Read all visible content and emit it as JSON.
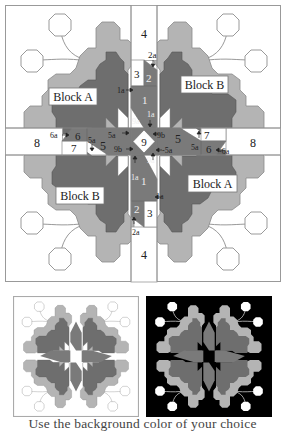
{
  "diagram": {
    "colors": {
      "background": "#ffffff",
      "light_fabric": "#b4b4b4",
      "dark_fabric": "#6e6e6e",
      "medium_fabric": "#8c8c8c",
      "outline": "#888888",
      "label_text": "#222222",
      "dark_preview_bg": "#000000"
    },
    "block_labels": {
      "top_left": "Block A",
      "top_right": "Block B",
      "bottom_left": "Block B",
      "bottom_right": "Block A"
    },
    "sashing_labels": {
      "top_4": "4",
      "bottom_4": "4",
      "left_8": "8",
      "right_8": "8",
      "center_9": "9"
    },
    "piece_labels": {
      "top": [
        "2a",
        "3",
        "2",
        "1a",
        "1",
        "1a",
        "9a"
      ],
      "left": [
        "6a",
        "6",
        "7",
        "5a",
        "5",
        "5a",
        "9b"
      ],
      "right": [
        "9b",
        "5",
        "5a",
        "7",
        "6",
        "-6a",
        "-5a"
      ],
      "bottom": [
        "9a",
        "1a",
        "1",
        "1a",
        "2",
        "3",
        "2a"
      ]
    }
  },
  "previews": [
    {
      "name": "light-background-quilt",
      "background": "#ffffff"
    },
    {
      "name": "dark-background-quilt",
      "background": "#000000"
    }
  ],
  "caption": "Use the background color of your choice"
}
